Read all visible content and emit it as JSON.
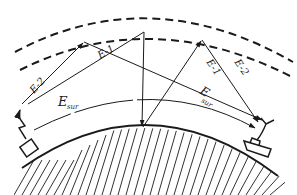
{
  "diagram": {
    "type": "radio-propagation-schematic",
    "labels": {
      "e2_left": "E-2",
      "e1_left": "E-1",
      "e1_right": "E-1",
      "e2_right": "E-2",
      "esur_left_main": "E",
      "esur_left_sub": "sur",
      "esur_right_main": "E",
      "esur_right_sub": "sur"
    },
    "elements": {
      "ionosphere_outer_layer": "dashed arc",
      "ionosphere_inner_layer": "dashed arc",
      "earth_surface": "hatched arc",
      "transmitter": "antenna with box",
      "receiver": "Y antenna on ship"
    },
    "colors": {
      "stroke": "#1a1a1a",
      "background": "#ffffff"
    }
  }
}
